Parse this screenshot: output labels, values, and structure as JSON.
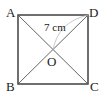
{
  "figure": {
    "shape": "square",
    "vertices": {
      "A": "A",
      "B": "B",
      "C": "C",
      "D": "D"
    },
    "center_label": "O",
    "measurement": {
      "segment": "OD",
      "label": "7 cm"
    },
    "diagonals": [
      "AC",
      "BD"
    ],
    "colors": {
      "stroke": "#333333",
      "diagonal": "#555555",
      "arc": "#bbbbbb",
      "text": "#222222"
    }
  }
}
